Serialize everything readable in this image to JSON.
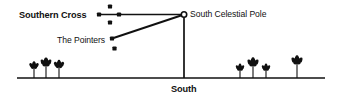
{
  "figure": {
    "type": "astronomy-diagram",
    "title_text": "",
    "background_color": "#ffffff",
    "ink_color": "#111111",
    "width": 341,
    "height": 99
  },
  "labels": {
    "southern_cross": "Southern Cross",
    "south_celestial_pole": "South Celestial Pole",
    "the_pointers": "The Pointers",
    "south": "South"
  },
  "markers": {
    "southern_cross_stars": [
      {
        "name": "left-star",
        "x": 99,
        "y": 14.5,
        "r": 2.1
      },
      {
        "name": "center-star",
        "x": 119,
        "y": 14.5,
        "r": 2.1
      },
      {
        "name": "top-star",
        "x": 110,
        "y": 6.5,
        "r": 2.1
      },
      {
        "name": "bottom-star",
        "x": 110,
        "y": 22.5,
        "r": 2.1
      }
    ],
    "pointer_stars": [
      {
        "name": "upper-pointer-star",
        "x": 112,
        "y": 38.5,
        "r": 2.1
      },
      {
        "name": "lower-pointer-star",
        "x": 114.5,
        "y": 48.5,
        "r": 2.1
      }
    ],
    "south_celestial_pole": {
      "x": 184,
      "y": 14.5,
      "r": 2.7
    }
  },
  "lines": {
    "cross_axis": {
      "x1": 99,
      "y1": 14.5,
      "x2": 184,
      "y2": 14.5
    },
    "pointer_axis": {
      "x1": 112,
      "y1": 38.5,
      "x2": 184,
      "y2": 14.5
    },
    "meridian": {
      "x1": 184,
      "y1": 14.5,
      "x2": 184,
      "y2": 78
    },
    "horizon": {
      "x1": 17,
      "y1": 78,
      "x2": 325,
      "y2": 78
    }
  },
  "scenery": {
    "trees": [
      {
        "name": "tree-left-1",
        "x": 34,
        "canopy_y": 66,
        "scale": 0.78,
        "trunk_y": 78
      },
      {
        "name": "tree-left-2",
        "x": 46,
        "canopy_y": 63,
        "scale": 0.92,
        "trunk_y": 78
      },
      {
        "name": "tree-left-3",
        "x": 59,
        "canopy_y": 65,
        "scale": 0.85,
        "trunk_y": 78
      },
      {
        "name": "tree-right-1",
        "x": 240,
        "canopy_y": 68,
        "scale": 0.72,
        "trunk_y": 78
      },
      {
        "name": "tree-right-2",
        "x": 253,
        "canopy_y": 63,
        "scale": 0.95,
        "trunk_y": 78
      },
      {
        "name": "tree-right-3",
        "x": 266,
        "canopy_y": 68,
        "scale": 0.72,
        "trunk_y": 78
      },
      {
        "name": "tree-right-solo",
        "x": 297,
        "canopy_y": 61,
        "scale": 0.95,
        "trunk_y": 78
      }
    ]
  }
}
